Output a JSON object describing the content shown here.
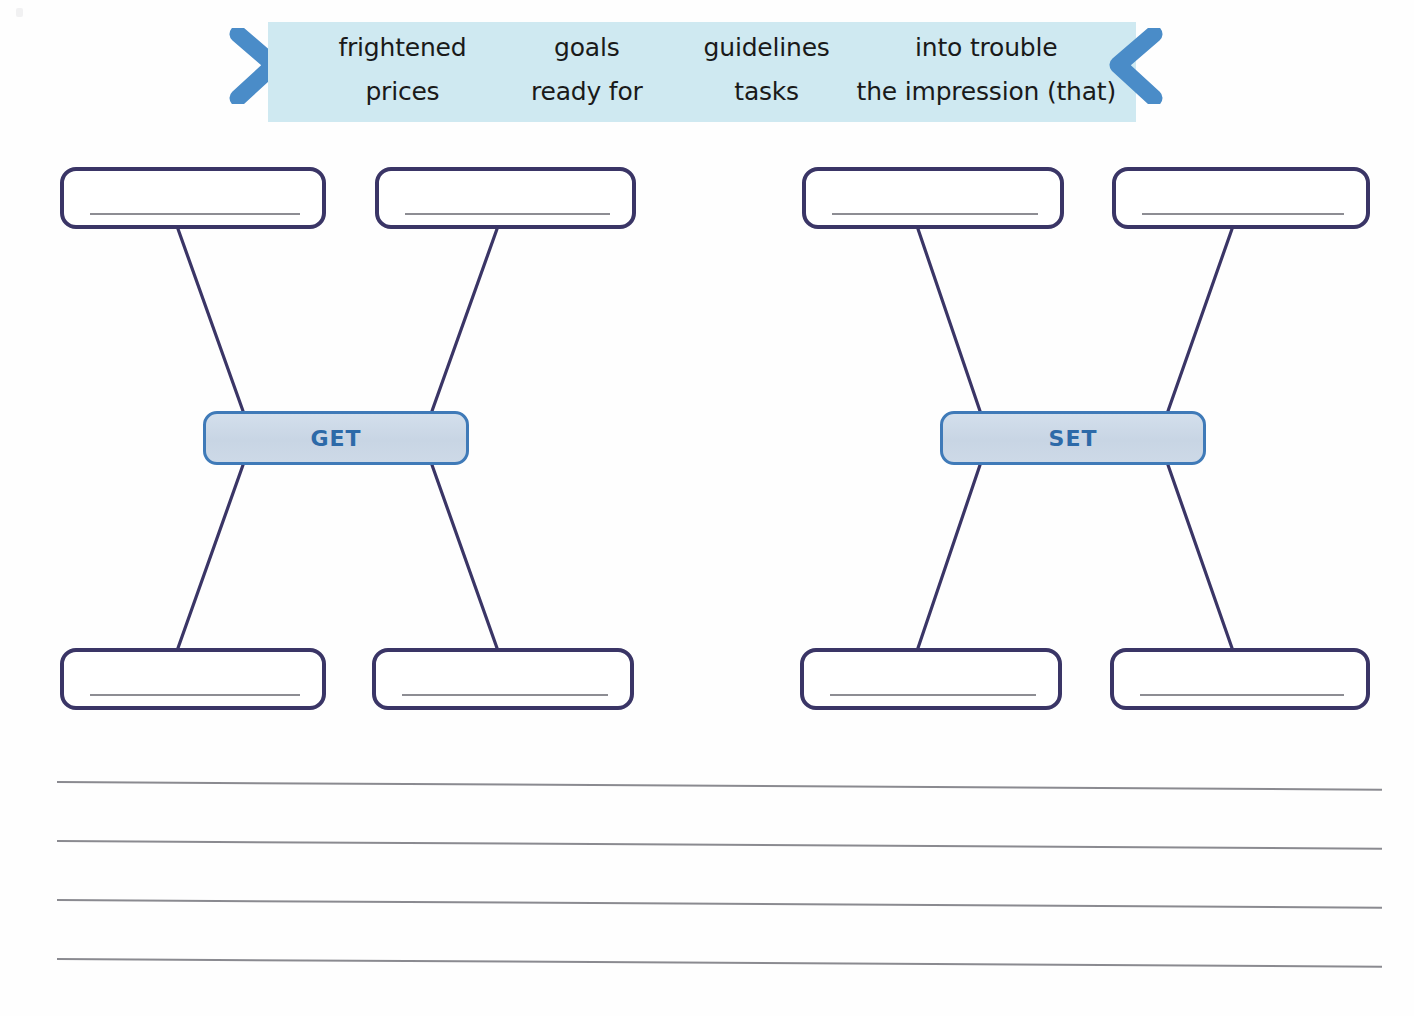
{
  "page": {
    "background_color": "#fefefe",
    "worksheet_type": "collocation-mind-map"
  },
  "word_bank": {
    "banner_color": "#cfe9f1",
    "chevron_color": "#4a8cc8",
    "left_chevron_icon": "chevron-right-icon",
    "right_chevron_icon": "chevron-left-icon",
    "words": [
      "frightened",
      "goals",
      "guidelines",
      "into trouble",
      "prices",
      "ready for",
      "tasks",
      "the impression (that)"
    ]
  },
  "clusters": [
    {
      "verb": "GET",
      "chip_border_color": "#3f7ab8",
      "chip_fill_color": "#cdd9e7",
      "chip_text_color": "#2d6aa8",
      "boxes": {
        "top_left": "",
        "top_right": "",
        "bottom_left": "",
        "bottom_right": ""
      }
    },
    {
      "verb": "SET",
      "chip_border_color": "#3f7ab8",
      "chip_fill_color": "#cdd9e7",
      "chip_text_color": "#2d6aa8",
      "boxes": {
        "top_left": "",
        "top_right": "",
        "bottom_left": "",
        "bottom_right": ""
      }
    }
  ],
  "box_style": {
    "border_color": "#3a3566",
    "writing_line_color": "#8d8d93"
  },
  "ruled_lines": {
    "count": 4,
    "color": "#8a8a90"
  }
}
